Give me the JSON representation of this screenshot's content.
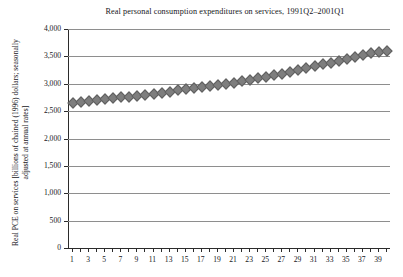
{
  "chart_data": {
    "type": "scatter",
    "title": "Real personal consumption expenditures on services, 1991Q2–2001Q1",
    "xlabel": "",
    "ylabel": "Real PCE on services [billions of chained (1996) dollars; seasonally adjusted at annual rates]",
    "ylim": [
      0,
      4000
    ],
    "ytick_labels": [
      "0",
      "500",
      "1,000",
      "1,500",
      "2,000",
      "2,500",
      "3,000",
      "3,500",
      "4,000"
    ],
    "ytick_values": [
      0,
      500,
      1000,
      1500,
      2000,
      2500,
      3000,
      3500,
      4000
    ],
    "xlim": [
      0.5,
      40.5
    ],
    "xtick_labels": [
      "1",
      "3",
      "5",
      "7",
      "9",
      "11",
      "13",
      "15",
      "17",
      "19",
      "21",
      "23",
      "25",
      "27",
      "29",
      "31",
      "33",
      "35",
      "37",
      "39"
    ],
    "xtick_values": [
      1,
      3,
      5,
      7,
      9,
      11,
      13,
      15,
      17,
      19,
      21,
      23,
      25,
      27,
      29,
      31,
      33,
      35,
      37,
      39
    ],
    "grid": "horizontal",
    "legend": "none",
    "marker_shape": "diamond",
    "marker_color": "#7e7e7e",
    "x": [
      1,
      2,
      3,
      4,
      5,
      6,
      7,
      8,
      9,
      10,
      11,
      12,
      13,
      14,
      15,
      16,
      17,
      18,
      19,
      20,
      21,
      22,
      23,
      24,
      25,
      26,
      27,
      28,
      29,
      30,
      31,
      32,
      33,
      34,
      35,
      36,
      37,
      38,
      39,
      40
    ],
    "values": [
      2675,
      2690,
      2700,
      2715,
      2735,
      2750,
      2770,
      2785,
      2800,
      2820,
      2840,
      2855,
      2875,
      2895,
      2915,
      2935,
      2955,
      2975,
      2995,
      3015,
      3040,
      3065,
      3090,
      3115,
      3145,
      3175,
      3205,
      3235,
      3265,
      3300,
      3335,
      3370,
      3405,
      3440,
      3475,
      3510,
      3545,
      3580,
      3605,
      3620
    ],
    "series_name": "Real PCE on services",
    "n_points": 40
  }
}
